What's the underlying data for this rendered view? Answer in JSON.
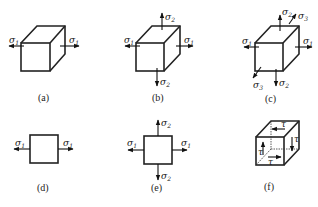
{
  "figure": {
    "panels": [
      {
        "id": "a",
        "caption": "(a)",
        "type": "cube",
        "stresses": [
          "σ1 (left, right)"
        ]
      },
      {
        "id": "b",
        "caption": "(b)",
        "type": "cube",
        "stresses": [
          "σ1 (left, right)",
          "σ2 (top, bottom)"
        ]
      },
      {
        "id": "c",
        "caption": "(c)",
        "type": "cube",
        "stresses": [
          "σ1 (left, right)",
          "σ2 (top, bottom)",
          "σ3 (front, back)"
        ]
      },
      {
        "id": "d",
        "caption": "(d)",
        "type": "square",
        "stresses": [
          "σ1 (left, right)"
        ]
      },
      {
        "id": "e",
        "caption": "(e)",
        "type": "square",
        "stresses": [
          "σ1 (left, right)",
          "σ2 (top, bottom)"
        ]
      },
      {
        "id": "f",
        "caption": "(f)",
        "type": "cube",
        "stresses": [
          "τ (shear on faces)"
        ]
      }
    ],
    "labels": {
      "sigma": "σ",
      "tau": "τ",
      "sub1": "1",
      "sub2": "2",
      "sub3": "3"
    }
  }
}
